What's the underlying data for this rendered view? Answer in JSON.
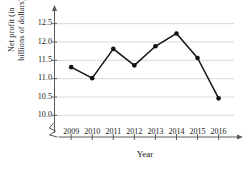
{
  "chart_data": {
    "type": "line",
    "title": "",
    "xlabel": "Year",
    "ylabel_line1": "Net profit (in",
    "ylabel_line2": "billions of dollars)",
    "categories": [
      "2009",
      "2010",
      "2011",
      "2012",
      "2013",
      "2014",
      "2015",
      "2016"
    ],
    "values": [
      11.3,
      11.0,
      11.8,
      11.35,
      11.87,
      12.22,
      11.55,
      10.45
    ],
    "ytick_labels": [
      "12.5",
      "12.0",
      "11.5",
      "11.0",
      "10.5",
      "10.0"
    ],
    "ytick_values": [
      12.5,
      12.0,
      11.5,
      11.0,
      10.5,
      10.0
    ],
    "ylim": [
      9.75,
      12.75
    ],
    "grid": true,
    "legend": "none",
    "axis_break": true,
    "series_color": "#111111",
    "grid_color": "#d8d8d8",
    "axis_color": "#5a5a5a"
  }
}
